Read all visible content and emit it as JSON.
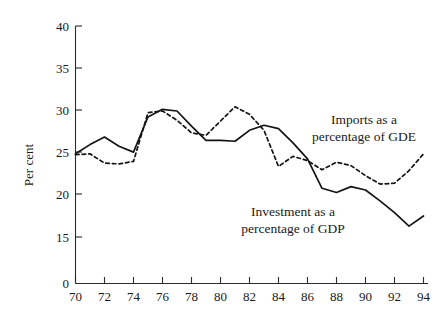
{
  "chart_data": {
    "type": "line",
    "title": "",
    "xlabel": "",
    "ylabel": "Per cent",
    "xlim": [
      70,
      95
    ],
    "ylim": [
      15,
      40
    ],
    "y_axis_broken_below": 15,
    "grid": false,
    "legend_position": "inline-annotations",
    "x_tick_labels": [
      "70",
      "72",
      "74",
      "76",
      "78",
      "80",
      "82",
      "84",
      "86",
      "88",
      "90",
      "92",
      "94"
    ],
    "y_tick_labels": [
      "0",
      "15",
      "20",
      "25",
      "30",
      "35",
      "40"
    ],
    "x": [
      70,
      71,
      72,
      73,
      74,
      75,
      76,
      77,
      78,
      79,
      80,
      81,
      82,
      83,
      84,
      85,
      86,
      87,
      88,
      89,
      90,
      91,
      92,
      93,
      94
    ],
    "series": [
      {
        "name": "Investment as a percentage of GDP",
        "style": "solid",
        "color": "#141414",
        "annotation": "Investment as a\npercentage of GDP",
        "values": [
          24.9,
          26.0,
          26.9,
          25.8,
          25.1,
          29.3,
          30.2,
          30.0,
          28.2,
          26.5,
          26.5,
          26.4,
          27.7,
          28.3,
          27.9,
          26.2,
          24.3,
          20.8,
          20.3,
          21.0,
          20.6,
          19.3,
          17.9,
          16.3,
          17.5
        ]
      },
      {
        "name": "Imports as a percentage of GDE",
        "style": "dashed",
        "color": "#141414",
        "annotation": "Imports as a\npercentage of GDE",
        "values": [
          24.8,
          24.9,
          23.8,
          23.7,
          24.0,
          29.8,
          30.0,
          28.9,
          27.4,
          27.1,
          28.8,
          30.5,
          29.6,
          27.7,
          23.4,
          24.6,
          24.1,
          23.0,
          23.9,
          23.5,
          22.3,
          21.3,
          21.4,
          22.9,
          24.9
        ]
      }
    ],
    "annotations": [
      {
        "text_line1": "Imports as a",
        "text_line2": "percentage of GDE"
      },
      {
        "text_line1": "Investment as a",
        "text_line2": "percentage of GDP"
      }
    ]
  }
}
